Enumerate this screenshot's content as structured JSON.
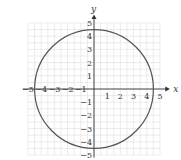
{
  "chart_data": {
    "type": "line",
    "title": "",
    "xlabel": "x",
    "ylabel": "y",
    "xlim": [
      -5,
      5
    ],
    "ylim": [
      -5,
      5
    ],
    "grid": true,
    "x_ticks": [
      -5,
      -4,
      -3,
      -2,
      -1,
      1,
      2,
      3,
      4,
      5
    ],
    "y_ticks": [
      -5,
      -4,
      -3,
      -2,
      -1,
      1,
      2,
      3,
      4,
      5
    ],
    "x_tick_labels": [
      "−5",
      "−4",
      "−3",
      "−2",
      "−1",
      "1",
      "2",
      "3",
      "4",
      "5"
    ],
    "y_tick_labels": [
      "−5",
      "−4",
      "−3",
      "−2",
      "−1",
      "1",
      "2",
      "3",
      "4",
      "5"
    ],
    "series": [
      {
        "name": "circle",
        "shape": "circle",
        "center": [
          0,
          0
        ],
        "radius": 4.5
      }
    ]
  },
  "colors": {
    "grid": "#d9d9d9",
    "axis": "#333333",
    "curve": "#555555"
  }
}
